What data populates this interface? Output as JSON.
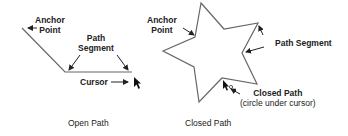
{
  "open_path": {
    "anchor_label_1": "Anchor",
    "anchor_label_2": "Point",
    "segment_label_1": "Path",
    "segment_label_2": "Segment",
    "cursor_label": "Cursor",
    "caption": "Open Path"
  },
  "closed_path": {
    "anchor_label_1": "Anchor",
    "anchor_label_2": "Point",
    "segment_label": "Path Segment",
    "closed_label_1": "Closed Path",
    "closed_label_2": "(circle under cursor)",
    "caption": "Closed Path"
  },
  "colors": {
    "stroke": "#666666",
    "text": "#222222"
  }
}
